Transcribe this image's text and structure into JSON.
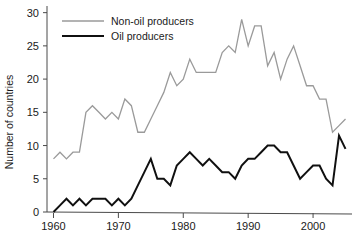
{
  "figure": {
    "caption_fragment": "",
    "background": "#ffffff"
  },
  "chart_data": {
    "type": "line",
    "title": "",
    "xlabel": "",
    "ylabel": "Number of countries",
    "xlim": [
      1959,
      2006
    ],
    "ylim": [
      0,
      31
    ],
    "xticks": [
      1960,
      1970,
      1980,
      1990,
      2000
    ],
    "xtick_labels": [
      "1960",
      "1970",
      "1980",
      "1990",
      "2000"
    ],
    "yticks": [
      0,
      5,
      10,
      15,
      20,
      25,
      30
    ],
    "ytick_labels": [
      "0",
      "5",
      "10",
      "15",
      "20",
      "25",
      "30"
    ],
    "grid": false,
    "legend_position": "top-left",
    "x": [
      1960,
      1961,
      1962,
      1963,
      1964,
      1965,
      1966,
      1967,
      1968,
      1969,
      1970,
      1971,
      1972,
      1973,
      1974,
      1975,
      1976,
      1977,
      1978,
      1979,
      1980,
      1981,
      1982,
      1983,
      1984,
      1985,
      1986,
      1987,
      1988,
      1989,
      1990,
      1991,
      1992,
      1993,
      1994,
      1995,
      1996,
      1997,
      1998,
      1999,
      2000,
      2001,
      2002,
      2003,
      2004,
      2005
    ],
    "series": [
      {
        "name": "Non-oil producers",
        "color": "#9a9a9a",
        "width": 1.3,
        "values": [
          8,
          9,
          8,
          9,
          9,
          15,
          16,
          15,
          14,
          15,
          14,
          17,
          16,
          12,
          12,
          14,
          16,
          18,
          21,
          19,
          20,
          23,
          21,
          21,
          21,
          21,
          24,
          25,
          24,
          29,
          25,
          28,
          28,
          22,
          24,
          20,
          23,
          25,
          22,
          19,
          19,
          17,
          17,
          12,
          13,
          14
        ]
      },
      {
        "name": "Oil producers",
        "color": "#101010",
        "width": 2.0,
        "values": [
          0,
          1,
          2,
          1,
          2,
          1,
          2,
          2,
          2,
          1,
          2,
          1,
          2,
          4,
          6,
          8,
          5,
          5,
          4,
          7,
          8,
          9,
          8,
          7,
          8,
          7,
          6,
          6,
          5,
          7,
          8,
          8,
          9,
          10,
          10,
          9,
          9,
          7,
          5,
          6,
          7,
          7,
          5,
          4,
          11.5,
          9.5
        ]
      }
    ]
  },
  "legend": {
    "items": [
      {
        "label": "Non-oil producers",
        "color": "#9a9a9a"
      },
      {
        "label": "Oil producers",
        "color": "#101010"
      }
    ]
  }
}
